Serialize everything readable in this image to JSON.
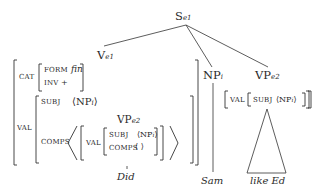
{
  "tree": {
    "root": {
      "label": "S",
      "sub": "e1"
    },
    "v": {
      "label": "V",
      "sub": "e1"
    },
    "np": {
      "label": "NP",
      "sub": "i"
    },
    "vp": {
      "label": "VP",
      "sub": "e2"
    },
    "inner_vp": {
      "label": "VP",
      "sub": "e2"
    }
  },
  "avm_v": {
    "cat": "CAT",
    "form": "FORM",
    "form_val": "fin",
    "inv": "INV",
    "inv_val": "+",
    "val": "VAL",
    "subj": "SUBJ",
    "subj_val_l": "⟨NP",
    "subj_val_sub": "i",
    "subj_val_r": "⟩",
    "comps": "COMPS",
    "comps_open": "⟨",
    "comps_close": "⟩",
    "inner_val": "VAL",
    "inner_subj": "SUBJ",
    "inner_subj_val": "⟨NP",
    "inner_subj_sub": "i",
    "inner_subj_r": "⟩",
    "inner_comps": "COMPS",
    "inner_comps_val": "⟨ ⟩"
  },
  "avm_vp": {
    "val": "VAL",
    "subj": "SUBJ",
    "subj_val": "⟨NP",
    "subj_sub": "i",
    "subj_r": "⟩"
  },
  "leaves": {
    "v": "Did",
    "np": "Sam",
    "vp": "like Ed"
  }
}
